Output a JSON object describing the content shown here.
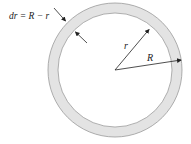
{
  "diagram": {
    "labels": {
      "thickness": "dr = R − r",
      "inner_radius": "r",
      "outer_radius": "R"
    },
    "colors": {
      "ring_fill": "#e3e3e3",
      "ring_stroke": "#9a9a9a",
      "arrow": "#222222"
    },
    "geometry": {
      "center": [
        115,
        70
      ],
      "outer_radius": 67,
      "inner_radius": 57
    },
    "caption_partial": ""
  }
}
